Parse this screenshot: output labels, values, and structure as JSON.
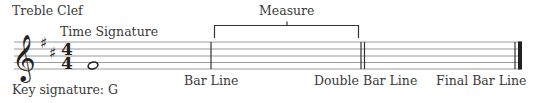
{
  "diagram": {
    "labels": {
      "treble_clef": "Treble Clef",
      "time_signature": "Time Signature",
      "measure": "Measure",
      "key_signature": "Key signature: G",
      "bar_line": "Bar Line",
      "double_bar_line": "Double Bar Line",
      "final_bar_line": "Final Bar Line"
    },
    "staff": {
      "line_count": 5,
      "lines_y": [
        42,
        49,
        56,
        62,
        69
      ],
      "x_start": 14,
      "x_end": 524,
      "line_color": "#9a9a9a"
    },
    "symbols": {
      "clef": "𝄞",
      "sharp": "♯",
      "time_sig_top": "4",
      "time_sig_bottom": "4",
      "note": "whole-note"
    },
    "bar_lines": {
      "bar_line_x": 211,
      "double_bar_x": [
        361,
        364
      ],
      "final_bar_thin_x": 515,
      "final_bar_thick_x": 519
    },
    "colors": {
      "ink": "#222222",
      "text": "#3a3a3a"
    }
  }
}
